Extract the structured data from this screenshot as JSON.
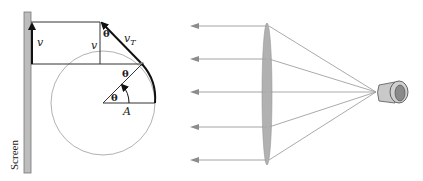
{
  "figure": {
    "left_panel": {
      "screen_label": "Screen",
      "velocity_label_screen": "v",
      "velocity_label_vertical": "v",
      "tangential_velocity_label": "v",
      "tangential_subscript": "T",
      "angle_label_top": "θ",
      "angle_label_mid": "θ",
      "angle_label_center": "θ",
      "amplitude_label": "A"
    },
    "right_panel": {
      "ray_count": 5,
      "description": "Point light source with converging lens producing parallel rays toward the left"
    },
    "colors": {
      "line": "#333333",
      "circle": "#999999",
      "screen_fill": "#bdbdbd",
      "lens_fill": "#a9a9a9",
      "ray": "#9a9a9a",
      "source_body": "#c8c8c8",
      "source_rim": "#888888"
    }
  }
}
